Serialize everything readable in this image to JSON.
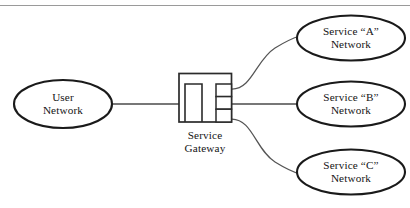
{
  "figure": {
    "kind": "network-topology-diagram",
    "background_color": "#ffffff",
    "line_color": "#1a1a1a",
    "text_color": "#141414",
    "top_rule_color": "#9a9a9a"
  },
  "nodes": {
    "user_network": {
      "label_line1": "User",
      "label_line2": "Network",
      "shape": "ellipse"
    },
    "gateway": {
      "label_line1": "Service",
      "label_line2": "Gateway",
      "shape": "rack-box",
      "port_count": 3
    },
    "service_a": {
      "label_line1": "Service “A”",
      "label_line2": "Network",
      "shape": "ellipse"
    },
    "service_b": {
      "label_line1": "Service “B”",
      "label_line2": "Network",
      "shape": "ellipse"
    },
    "service_c": {
      "label_line1": "Service “C”",
      "label_line2": "Network",
      "shape": "ellipse"
    }
  },
  "links": [
    {
      "id": "user-to-gateway",
      "from": "user_network",
      "to": "gateway",
      "style": "straight"
    },
    {
      "id": "gateway-to-service-a",
      "from": "gateway",
      "to": "service_a",
      "style": "curve-up"
    },
    {
      "id": "gateway-to-service-b",
      "from": "gateway",
      "to": "service_b",
      "style": "straight"
    },
    {
      "id": "gateway-to-service-c",
      "from": "gateway",
      "to": "service_c",
      "style": "curve-down"
    }
  ]
}
